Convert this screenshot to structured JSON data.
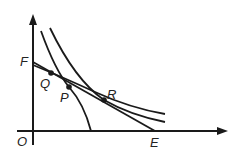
{
  "diagram": {
    "type": "coordinate-geometry",
    "axes": {
      "origin_label": "O",
      "x_axis": "horizontal",
      "y_axis": "vertical"
    },
    "labels": {
      "O": "O",
      "F": "F",
      "E": "E",
      "Q": "Q",
      "P": "P",
      "R": "R"
    },
    "points": [
      {
        "name": "Q",
        "x": 51,
        "y": 73
      },
      {
        "name": "P",
        "x": 69,
        "y": 87
      },
      {
        "name": "R",
        "x": 104,
        "y": 100
      }
    ],
    "colors": {
      "stroke": "#1a1a1a",
      "background": "#ffffff"
    }
  }
}
